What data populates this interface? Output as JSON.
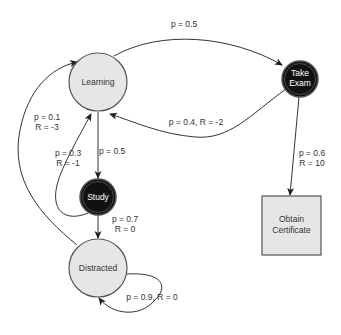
{
  "colors": {
    "light_node_fill": "#e6e6e6",
    "dark_node_fill": "#111111",
    "stroke": "#444444",
    "label": "#333333",
    "background": "#ffffff"
  },
  "nodes": {
    "learning": {
      "label": "Learning"
    },
    "take_exam": {
      "label_line1": "Take",
      "label_line2": "Exam"
    },
    "study": {
      "label": "Study"
    },
    "distracted": {
      "label": "Distracted"
    },
    "obtain_certificate": {
      "label_line1": "Obtain",
      "label_line2": "Certificate"
    }
  },
  "edges": {
    "learning_to_exam": {
      "label": "p = 0.5"
    },
    "exam_to_learning": {
      "label": "p = 0.4, R = -2"
    },
    "learning_to_study": {
      "label": "p = 0.5"
    },
    "study_to_learning": {
      "label_line1": "p = 0.3",
      "label_line2": "R = -1"
    },
    "distracted_to_learning": {
      "label_line1": "p = 0.1",
      "label_line2": "R = -3"
    },
    "study_to_distracted": {
      "label_line1": "p = 0.7",
      "label_line2": "R = 0"
    },
    "distracted_self": {
      "label": "p = 0.9, R = 0"
    },
    "exam_to_certificate": {
      "label_line1": "p = 0.6",
      "label_line2": "R = 10"
    }
  }
}
